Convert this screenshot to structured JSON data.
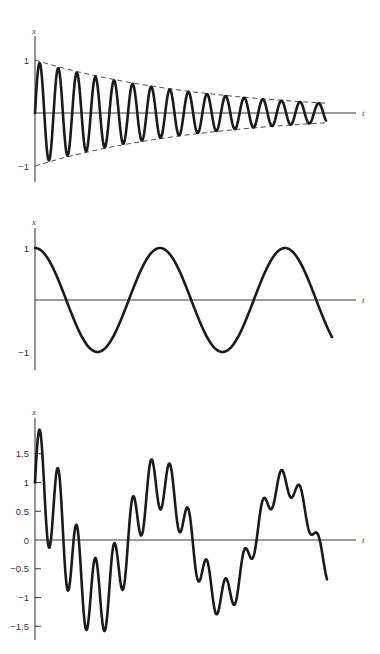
{
  "chart_data": [
    {
      "type": "line",
      "title": "",
      "xlabel": "t",
      "ylabel": "x",
      "yticks": [
        "1",
        "-1"
      ],
      "ylim": [
        -1.25,
        1.5
      ],
      "grid": false,
      "series": [
        {
          "name": "damped oscillation",
          "formula": "exp(-0.0058*(px)) * sin(2*pi*(px)/18.6)",
          "style": "solid"
        },
        {
          "name": "upper envelope",
          "formula": "exp(-decay*t)",
          "style": "dashed"
        },
        {
          "name": "lower envelope",
          "formula": "-exp(-decay*t)",
          "style": "dashed"
        }
      ],
      "peaks_approx": [
        0.95,
        0.85,
        0.76,
        0.68,
        0.61,
        0.55,
        0.49,
        0.44,
        0.39,
        0.35,
        0.31,
        0.28,
        0.25,
        0.22,
        0.2,
        0.18
      ],
      "x_end_value": -0.1
    },
    {
      "type": "line",
      "title": "",
      "xlabel": "t",
      "ylabel": "x",
      "yticks": [
        "1",
        "-1"
      ],
      "ylim": [
        -1.35,
        1.5
      ],
      "grid": false,
      "series": [
        {
          "name": "undamped oscillation",
          "formula": "cos(2*pi*(px)/125)",
          "style": "solid"
        }
      ],
      "peaks_at_fraction_of_period": [
        0,
        1,
        2
      ],
      "x_end_value": -0.75
    },
    {
      "type": "line",
      "title": "",
      "xlabel": "t",
      "ylabel": "x",
      "yticks": [
        "1.5",
        "1",
        "0.5",
        "0",
        "-0.5",
        "-1",
        "-1.5"
      ],
      "ylim": [
        -1.75,
        2.2
      ],
      "grid": false,
      "series": [
        {
          "name": "superposition",
          "formula": "cos(2*pi*(px)/125) + exp(-0.0058*(px)) * sin(2*pi*(px)/18.6)",
          "style": "solid"
        }
      ],
      "key_points": [
        {
          "x_px": 40,
          "y": 1.9
        },
        {
          "x_px": 50,
          "y": -0.1
        },
        {
          "x_px": 58,
          "y": 1.2
        },
        {
          "x_px": 68,
          "y": -0.8
        },
        {
          "x_px": 77,
          "y": 0.2
        },
        {
          "x_px": 87,
          "y": -1.5
        },
        {
          "x_px": 96,
          "y": -0.45
        },
        {
          "x_px": 105,
          "y": -1.5
        },
        {
          "x_px": 114,
          "y": -0.15
        },
        {
          "x_px": 123,
          "y": -0.75
        },
        {
          "x_px": 133,
          "y": 0.65
        },
        {
          "x_px": 142,
          "y": 0.25
        },
        {
          "x_px": 151,
          "y": 1.3
        },
        {
          "x_px": 160,
          "y": 0.7
        },
        {
          "x_px": 169,
          "y": 1.2
        },
        {
          "x_px": 178,
          "y": 0.25
        },
        {
          "x_px": 186,
          "y": 0.4
        },
        {
          "x_px": 197,
          "y": -0.65
        },
        {
          "x_px": 205,
          "y": -0.5
        },
        {
          "x_px": 215,
          "y": -1.2
        },
        {
          "x_px": 225,
          "y": -0.8
        },
        {
          "x_px": 232,
          "y": -0.95
        },
        {
          "x_px": 243,
          "y": -0.15
        },
        {
          "x_px": 262,
          "y": 0.75
        },
        {
          "x_px": 279,
          "y": 1.15
        },
        {
          "x_px": 293,
          "y": 0.85
        },
        {
          "x_px": 310,
          "y": 0.0
        },
        {
          "x_px": 327,
          "y": -0.8
        }
      ],
      "x_end_value": -0.8
    }
  ],
  "plots": [
    {
      "ylabel": "x",
      "xlabel": "t",
      "ticks": [
        {
          "label": "1",
          "v": 1
        },
        {
          "label": "−1",
          "v": -1
        }
      ]
    },
    {
      "ylabel": "x",
      "xlabel": "t",
      "ticks": [
        {
          "label": "1",
          "v": 1
        },
        {
          "label": "−1",
          "v": -1
        }
      ]
    },
    {
      "ylabel": "x",
      "xlabel": "t",
      "ticks": [
        {
          "label": "1.5",
          "v": 1.5,
          "color": "#3a3a3a"
        },
        {
          "label": "1",
          "v": 1,
          "color": "#b04040"
        },
        {
          "label": "0.5",
          "v": 0.5,
          "color": "#a0a030"
        },
        {
          "label": "0",
          "v": 0,
          "color": "#3a3a3a"
        },
        {
          "label": "−0.5",
          "v": -0.5,
          "color": "#3a3a3a"
        },
        {
          "label": "−1",
          "v": -1,
          "color": "#3a9a50"
        },
        {
          "label": "−1.5",
          "v": -1.5,
          "color": "#3a3a9a"
        }
      ]
    }
  ],
  "layout": {
    "origin_x": 35,
    "axis_end_x": 356,
    "tlabel_x": 362,
    "top": {
      "zero_y": 113,
      "unit": 53,
      "axis_top": 36,
      "axis_bot": 182,
      "xlabel_y": 31,
      "curve_end_x": 326,
      "env_end_x": 326
    },
    "middle": {
      "zero_y": 300,
      "unit": 52,
      "axis_top": 228,
      "axis_bot": 370,
      "xlabel_y": 222,
      "curve_end_x": 332
    },
    "bottom": {
      "zero_y": 540,
      "unit": 57.5,
      "axis_top": 418,
      "axis_bot": 640,
      "xlabel_y": 412,
      "curve_end_x": 327
    }
  },
  "params": {
    "fast_period_px": 18.6,
    "slow_period_px": 125,
    "decay_per_px": 0.0058,
    "damped_amp": 0.97
  }
}
